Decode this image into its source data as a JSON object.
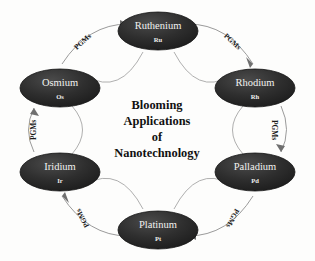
{
  "diagram": {
    "title_lines": [
      "Blooming",
      "Applications",
      "of",
      "Nanotechnology"
    ],
    "center_text": "Blooming Applications of Nanotechnology",
    "background_color": "#fdfdfc",
    "node_fill_color": "#2a2a2a",
    "node_text_color": "#f2f2f0",
    "connector_color": "#8e8e8e",
    "label_text_color": "#1a1a1a",
    "nodes": [
      {
        "id": "ruthenium",
        "name": "Ruthenium",
        "symbol": "Ru",
        "cx": 158,
        "cy": 31
      },
      {
        "id": "rhodium",
        "name": "Rhodium",
        "symbol": "Rh",
        "cx": 255,
        "cy": 88
      },
      {
        "id": "palladium",
        "name": "Palladium",
        "symbol": "Pd",
        "cx": 255,
        "cy": 172
      },
      {
        "id": "platinum",
        "name": "Platinum",
        "symbol": "Pt",
        "cx": 158,
        "cy": 230
      },
      {
        "id": "iridium",
        "name": "Iridium",
        "symbol": "Ir",
        "cx": 60,
        "cy": 172
      },
      {
        "id": "osmium",
        "name": "Osmium",
        "symbol": "Os",
        "cx": 60,
        "cy": 88
      }
    ],
    "edges": [
      {
        "id": "edge-osmium-ruthenium",
        "label": "PGMs",
        "from": "osmium",
        "to": "ruthenium",
        "lx": 83,
        "ly": 42,
        "rotation": -42
      },
      {
        "id": "edge-ruthenium-rhodium",
        "label": "PGMs",
        "from": "ruthenium",
        "to": "rhodium",
        "lx": 232,
        "ly": 42,
        "rotation": 42
      },
      {
        "id": "edge-rhodium-palladium",
        "label": "PGMs",
        "from": "rhodium",
        "to": "palladium",
        "lx": 274,
        "ly": 130,
        "rotation": 90
      },
      {
        "id": "edge-palladium-platinum",
        "label": "PGMs",
        "from": "palladium",
        "to": "platinum",
        "lx": 232,
        "ly": 218,
        "rotation": 118
      },
      {
        "id": "edge-platinum-iridium",
        "label": "PGMs",
        "from": "platinum",
        "to": "iridium",
        "lx": 83,
        "ly": 218,
        "rotation": -118
      },
      {
        "id": "edge-iridium-osmium",
        "label": "PGMs",
        "from": "iridium",
        "to": "osmium",
        "lx": 34,
        "ly": 130,
        "rotation": -90
      }
    ]
  }
}
